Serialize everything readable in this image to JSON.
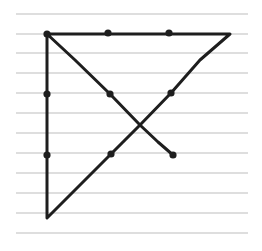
{
  "diagram": {
    "paper": {
      "background": "#ffffff",
      "rule_color": "#bdbdbd",
      "rule_x_start": 16,
      "rule_x_end": 248,
      "rule_ys": [
        14,
        34,
        53,
        73,
        93,
        113,
        133,
        153,
        173,
        193,
        213,
        233
      ]
    },
    "ink_color": "#1e1e1e",
    "dots": [
      {
        "x": 47,
        "y": 34
      },
      {
        "x": 108,
        "y": 33
      },
      {
        "x": 169,
        "y": 33
      },
      {
        "x": 47,
        "y": 94
      },
      {
        "x": 110,
        "y": 94
      },
      {
        "x": 171,
        "y": 93
      },
      {
        "x": 47,
        "y": 155
      },
      {
        "x": 111,
        "y": 154
      },
      {
        "x": 173,
        "y": 155
      }
    ],
    "stroke_path": [
      {
        "x": 173,
        "y": 155
      },
      {
        "x": 158,
        "y": 142
      },
      {
        "x": 140,
        "y": 125
      },
      {
        "x": 110,
        "y": 94
      },
      {
        "x": 75,
        "y": 60
      },
      {
        "x": 47,
        "y": 34
      },
      {
        "x": 140,
        "y": 34
      },
      {
        "x": 230,
        "y": 34
      },
      {
        "x": 200,
        "y": 60
      },
      {
        "x": 171,
        "y": 93
      },
      {
        "x": 140,
        "y": 125
      },
      {
        "x": 111,
        "y": 154
      },
      {
        "x": 70,
        "y": 195
      },
      {
        "x": 47,
        "y": 218
      },
      {
        "x": 47,
        "y": 155
      },
      {
        "x": 47,
        "y": 94
      },
      {
        "x": 47,
        "y": 34
      }
    ]
  }
}
